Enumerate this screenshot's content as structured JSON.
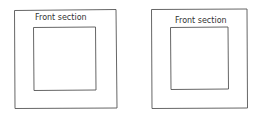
{
  "panels": [
    {
      "label": "Front section"
    },
    {
      "label": "Front section"
    }
  ],
  "colors": {
    "stroke": "#555555",
    "background": "#ffffff"
  }
}
